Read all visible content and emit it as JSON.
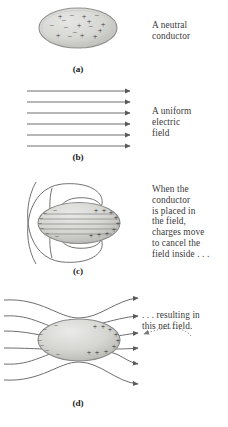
{
  "figure": {
    "background_color": "#ffffff",
    "ink_color": "#4a4a4a",
    "text_color": "#3a3a3a",
    "conductor_fill": "#d8d8d6",
    "conductor_edge": "#8f8f8d"
  },
  "panels": [
    {
      "id": "a",
      "label": "(a)",
      "caption_lines": [
        "A neutral",
        "conductor"
      ],
      "caption_text": "A neutral conductor",
      "conductor": {
        "charges_visible": true,
        "arrangement": "random-mixed",
        "plus_count": 9,
        "minus_count": 8,
        "interior_field_lines": 0
      },
      "field_arrows": 0
    },
    {
      "id": "b",
      "label": "(b)",
      "caption_lines": [
        "A uniform",
        "electric",
        "field"
      ],
      "caption_text": "A uniform electric field",
      "conductor": null,
      "field_arrows": 6,
      "field_direction": "left-to-right",
      "field_uniform": true
    },
    {
      "id": "c",
      "label": "(c)",
      "caption_lines": [
        "When the",
        "conductor",
        "is placed in",
        "the field,",
        "charges move",
        "to cancel the",
        "field inside . . ."
      ],
      "caption_text": "When the conductor is placed in the field, charges move to cancel the field inside . . .",
      "conductor": {
        "charges_visible": true,
        "arrangement": "polarized",
        "minus_side": "left",
        "plus_side": "right",
        "interior_field_lines": 5
      },
      "field_loops": 4,
      "field_description": "induced-charge loops curving into conductor"
    },
    {
      "id": "d",
      "label": "(d)",
      "caption_lines": [
        ". . . resulting in",
        "this net field."
      ],
      "caption_text": ". . . resulting in this net field.",
      "conductor": {
        "charges_visible": true,
        "arrangement": "polarized",
        "minus_side": "left",
        "plus_side": "right",
        "interior_field_lines": 0
      },
      "field_arrows": 6,
      "field_description": "net field deflected around conductor",
      "callout": {
        "style": "dotted-curved-arrow",
        "points_to": "left"
      }
    }
  ]
}
